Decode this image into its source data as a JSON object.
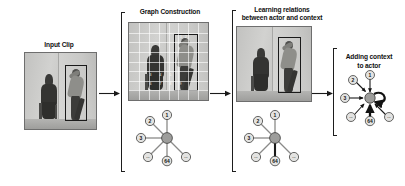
{
  "figure": {
    "background_color": "#ffffff",
    "width": 405,
    "height": 186
  },
  "stages": [
    {
      "id": "input-clip",
      "title": "Input Clip",
      "has_bracket": false,
      "has_grid": false,
      "has_graph": false,
      "photo_description": "grayscale video frame of a seated person on the left and a standing person on the right inside a black bounding box"
    },
    {
      "id": "graph-construction",
      "title": "Graph Construction",
      "has_bracket": true,
      "has_grid": true,
      "has_graph": true,
      "photo_description": "same frame overlaid with a white feature grid"
    },
    {
      "id": "learning-relations",
      "title": "Learning relations\nbetween actor and context",
      "has_bracket": true,
      "has_grid": false,
      "has_graph": true,
      "photo_description": "same frame with the actor bounding box highlighted"
    },
    {
      "id": "adding-context",
      "title": "Adding context\nto actor",
      "has_bracket": true,
      "has_grid": false,
      "has_graph": true
    }
  ],
  "graph": {
    "hub_label": "",
    "hub_color": "#9d9d9b",
    "node_fill": "#e3e3e1",
    "node_stroke": "#2a2a28",
    "nodes": [
      {
        "label": "1",
        "angle_deg": -70
      },
      {
        "label": "2",
        "angle_deg": -140
      },
      {
        "label": "3",
        "angle_deg": 180
      },
      {
        "label": "...",
        "angle_deg": 132
      },
      {
        "label": "64",
        "angle_deg": 90
      },
      {
        "label": "...",
        "angle_deg": 40
      }
    ],
    "highlighted_node_label": "64",
    "edge_color": "#8a8a88",
    "highlight_color": "#1a1a1a"
  },
  "flow_arrows": [
    {
      "from": "input-clip",
      "to": "graph-construction"
    },
    {
      "from": "graph-construction",
      "to": "learning-relations"
    },
    {
      "from": "learning-relations",
      "to": "adding-context"
    }
  ],
  "grid_cell_numbers": [
    "1",
    "2",
    "3",
    "4",
    "5",
    "6",
    "7",
    "8",
    "9",
    "10",
    "11",
    "12"
  ]
}
